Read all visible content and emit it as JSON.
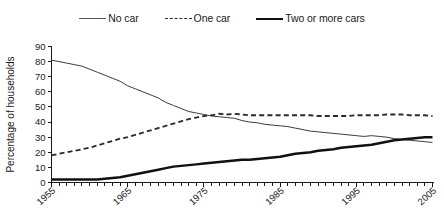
{
  "chart_data": {
    "type": "line",
    "title": "",
    "xlabel": "",
    "ylabel": "Percentage of households",
    "xlim": [
      1955,
      2005
    ],
    "ylim": [
      0,
      90
    ],
    "grid": false,
    "legend_position": "top",
    "ytick_labels": [
      "0",
      "10",
      "20",
      "30",
      "40",
      "50",
      "60",
      "70",
      "80",
      "90"
    ],
    "ytick_values": [
      0,
      10,
      20,
      30,
      40,
      50,
      60,
      70,
      80,
      90
    ],
    "xtick_labels": [
      "1955",
      "1965",
      "1975",
      "1985",
      "1995",
      "2005"
    ],
    "xtick_values": [
      1955,
      1965,
      1975,
      1985,
      1995,
      2005
    ],
    "xminor_step": 1,
    "x": [
      1955,
      1956,
      1957,
      1958,
      1959,
      1960,
      1961,
      1962,
      1963,
      1964,
      1965,
      1966,
      1967,
      1968,
      1969,
      1970,
      1971,
      1972,
      1973,
      1974,
      1975,
      1976,
      1977,
      1978,
      1979,
      1980,
      1981,
      1982,
      1983,
      1984,
      1985,
      1986,
      1987,
      1988,
      1989,
      1990,
      1991,
      1992,
      1993,
      1994,
      1995,
      1996,
      1997,
      1998,
      1999,
      2000,
      2001,
      2002,
      2003,
      2004,
      2005
    ],
    "series": [
      {
        "name": "No car",
        "style": "solid-thin",
        "color": "#3c3c3c",
        "values": [
          81,
          80,
          79,
          78,
          77,
          75,
          73,
          71,
          69,
          67,
          64,
          62,
          60,
          58,
          56,
          53,
          51,
          49,
          47,
          46,
          45,
          44,
          43.5,
          43,
          42.5,
          41,
          40,
          39.5,
          38.5,
          38,
          37.5,
          37,
          36,
          35,
          34,
          33.5,
          33,
          32.5,
          32,
          31.5,
          31,
          30.5,
          31,
          30.5,
          30,
          29,
          28.5,
          28,
          27.5,
          27,
          26.5
        ]
      },
      {
        "name": "One car",
        "style": "dashed",
        "color": "#2a2a2a",
        "values": [
          18,
          19,
          20,
          21,
          22,
          23,
          24.5,
          26,
          27.5,
          29,
          30,
          31.5,
          33,
          34.5,
          36,
          37.5,
          39,
          40.5,
          42,
          43,
          44,
          44.5,
          45.5,
          45,
          45.5,
          45,
          44.5,
          44.5,
          44.5,
          44.5,
          44.5,
          44.5,
          44.5,
          44.5,
          44.5,
          44,
          44,
          44,
          44,
          44,
          44.5,
          44.5,
          44.5,
          44.5,
          45,
          45,
          45,
          44.5,
          44.5,
          44.5,
          44
        ]
      },
      {
        "name": "Two or more cars",
        "style": "solid-thick",
        "color": "#111111",
        "values": [
          2,
          2,
          2,
          2,
          2,
          2,
          2,
          2.5,
          3,
          3.5,
          4.5,
          5.5,
          6.5,
          7.5,
          8.5,
          9.5,
          10.5,
          11,
          11.5,
          12,
          12.5,
          13,
          13.5,
          14,
          14.5,
          15,
          15,
          15.5,
          16,
          16.5,
          17,
          18,
          19,
          19.5,
          20,
          21,
          21.5,
          22,
          23,
          23.5,
          24,
          24.5,
          25,
          26,
          27,
          28,
          28.5,
          29,
          29.5,
          30,
          30
        ]
      }
    ]
  },
  "legend": {
    "items": [
      {
        "label": "No car",
        "swatch": "solid-thin-line-icon"
      },
      {
        "label": "One car",
        "swatch": "dashed-line-icon"
      },
      {
        "label": "Two or more cars",
        "swatch": "solid-thick-line-icon"
      }
    ]
  },
  "axes": {
    "y_title": "Percentage of households"
  }
}
